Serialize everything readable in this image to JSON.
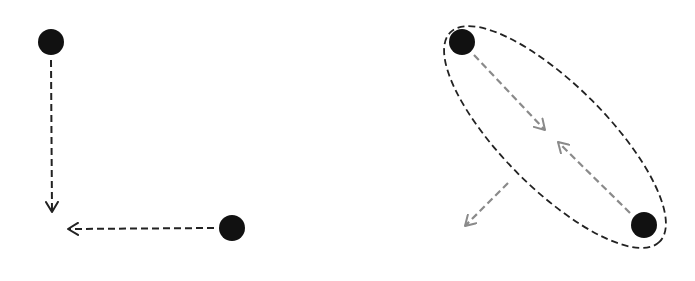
{
  "diagram": {
    "colors": {
      "dot": "#111111",
      "black_dash": "#222222",
      "gray_dash": "#8a8a8a",
      "background": "#ffffff"
    },
    "left_panel": {
      "dots": [
        {
          "cx": 51,
          "cy": 42,
          "r": 13
        },
        {
          "cx": 232,
          "cy": 228,
          "r": 13
        }
      ],
      "arrows": [
        {
          "name": "down-arrow",
          "x1": 51,
          "y1": 60,
          "x2": 52,
          "y2": 212,
          "color": "black"
        },
        {
          "name": "left-arrow",
          "x1": 214,
          "y1": 228,
          "x2": 68,
          "y2": 229,
          "color": "black"
        }
      ]
    },
    "right_panel": {
      "ellipse": {
        "cx": 555,
        "cy": 137,
        "rx": 148,
        "ry": 52,
        "rotation": 45
      },
      "dots": [
        {
          "cx": 462,
          "cy": 42,
          "r": 13
        },
        {
          "cx": 644,
          "cy": 225,
          "r": 13
        }
      ],
      "arrows": [
        {
          "name": "inward-arrow-top",
          "x1": 474,
          "y1": 55,
          "x2": 545,
          "y2": 130,
          "color": "gray"
        },
        {
          "name": "inward-arrow-bottom",
          "x1": 630,
          "y1": 213,
          "x2": 558,
          "y2": 142,
          "color": "gray"
        },
        {
          "name": "outward-arrow",
          "x1": 508,
          "y1": 183,
          "x2": 465,
          "y2": 226,
          "color": "gray"
        }
      ]
    }
  }
}
